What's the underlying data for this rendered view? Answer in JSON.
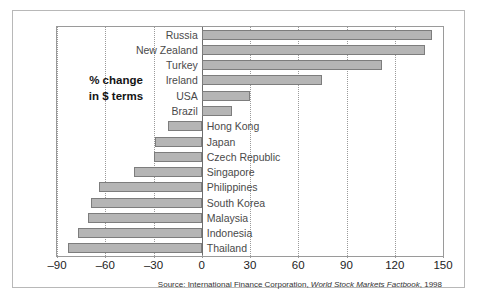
{
  "chart_data": {
    "type": "bar",
    "orientation": "horizontal",
    "title": "% change\nin $ terms",
    "title_line1": "% change",
    "title_line2": "in $ terms",
    "xlabel": "",
    "ylabel": "",
    "xlim": [
      -90,
      150
    ],
    "xticks": [
      -90,
      -60,
      -30,
      0,
      30,
      60,
      90,
      120,
      150
    ],
    "xtick_labels": [
      "–90",
      "–60",
      "–30",
      "0",
      "30",
      "60",
      "90",
      "120",
      "150"
    ],
    "grid": true,
    "grid_axis": "x",
    "legend": "none",
    "categories": [
      "Russia",
      "New Zealand",
      "Turkey",
      "Ireland",
      "USA",
      "Brazil",
      "Hong Kong",
      "Japan",
      "Czech Republic",
      "Singapore",
      "Philippines",
      "South Korea",
      "Malaysia",
      "Indonesia",
      "Thailand"
    ],
    "values": [
      143,
      139,
      112,
      75,
      30,
      19,
      -21,
      -29,
      -30,
      -42,
      -64,
      -69,
      -71,
      -77,
      -83
    ],
    "bar_color": "#b5b5b5",
    "bar_edge_color": "#7d7d7d",
    "source": "Source: International Finance Corporation, World Stock Markets Factbook, 1998",
    "source_prefix": "Source: International Finance Corporation, ",
    "source_italic": "World Stock Markets Factbook",
    "source_suffix": ", 1998"
  }
}
